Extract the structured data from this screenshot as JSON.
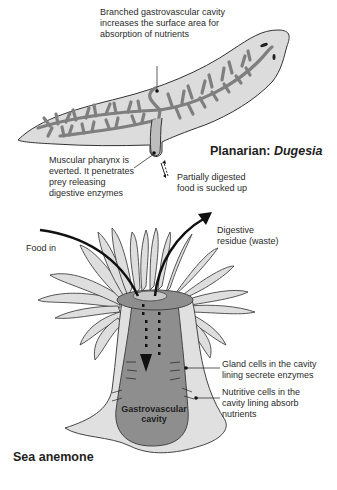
{
  "planarian": {
    "title_prefix": "Planarian: ",
    "title_genus": "Dugesia",
    "labels": {
      "branched_cavity": "Branched gastrovascular cavity\nincreases the surface area for\nabsorption of nutrients",
      "pharynx": "Muscular pharynx is\neverted. It penetrates\nprey releasing\ndigestive enzymes",
      "sucked_up": "Partially digested\nfood is sucked up"
    }
  },
  "sea_anemone": {
    "title": "Sea anemone",
    "labels": {
      "food_in": "Food in",
      "waste": "Digestive\nresidue (waste)",
      "gland_cells": "Gland cells in the cavity\nlining secrete enzymes",
      "nutritive_cells": "Nutritive cells in the\ncavity lining absorb\nnutrients",
      "cavity": "Gastrovascular\ncavity"
    }
  },
  "colors": {
    "body_fill": "#dcdcdc",
    "cavity_fill": "#8e8e8e",
    "outline": "#333333",
    "arrow": "#111111"
  }
}
